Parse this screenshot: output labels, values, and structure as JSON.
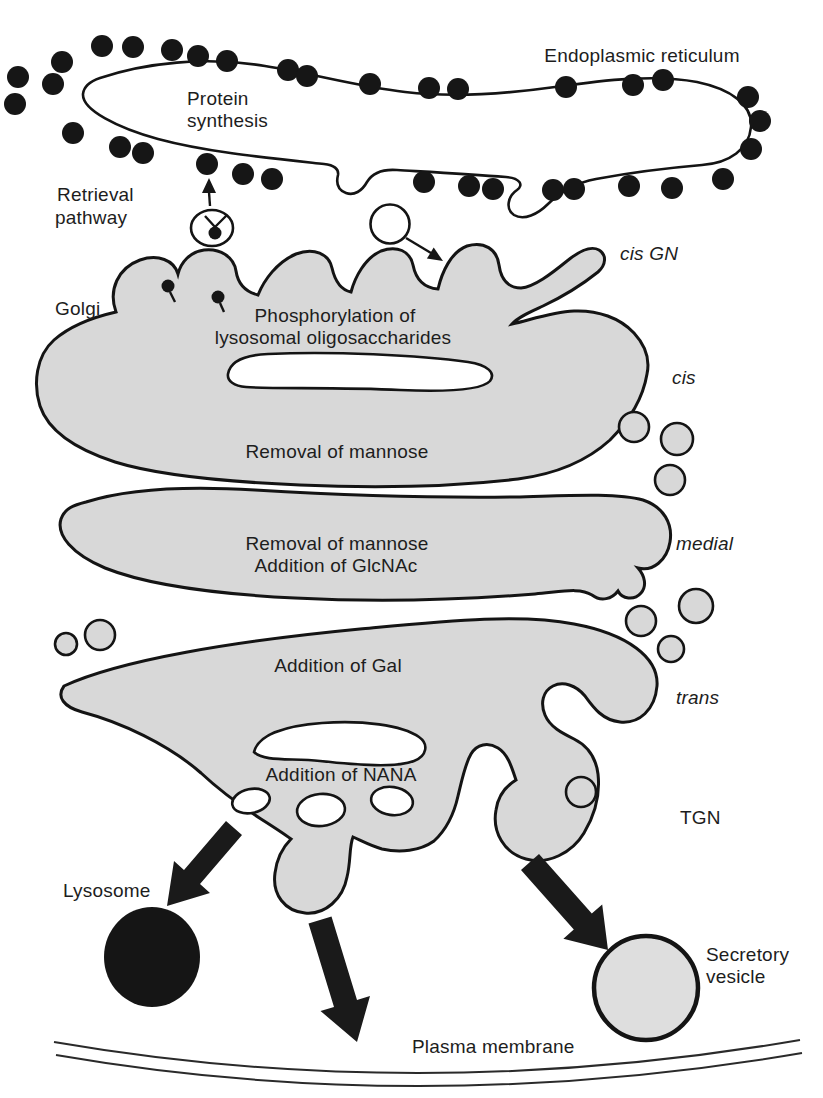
{
  "labels": {
    "endoplasmic_reticulum": "Endoplasmic reticulum",
    "protein_synthesis_line1": "Protein",
    "protein_synthesis_line2": "synthesis",
    "retrieval_line1": "Retrieval",
    "retrieval_line2": "pathway",
    "cis_gn": "cis GN",
    "golgi": "Golgi",
    "phospho_line1": "Phosphorylation of",
    "phospho_line2": "lysosomal oligosaccharides",
    "cis": "cis",
    "removal_mannose_cis": "Removal of mannose",
    "medial_line1": "Removal of mannose",
    "medial_line2": "Addition of GlcNAc",
    "medial": "medial",
    "addition_gal": "Addition of Gal",
    "trans": "trans",
    "addition_nana": "Addition of NANA",
    "tgn": "TGN",
    "lysosome": "Lysosome",
    "secretory_line1": "Secretory",
    "secretory_line2": "vesicle",
    "plasma_membrane": "Plasma membrane"
  },
  "colors": {
    "background": "#ffffff",
    "cisterna_fill": "#d8d8d8",
    "membrane_outline": "#141414",
    "ribosome_dot": "#161616",
    "lysosome_fill": "#151515",
    "arrow_fill": "#1a1a1a",
    "white_lumen": "#ffffff",
    "text": "#1d1d1d"
  }
}
